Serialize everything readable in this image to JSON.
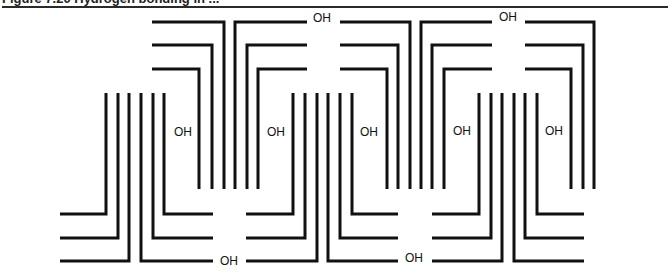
{
  "figure": {
    "caption": "Figure 7.20  Hydrogen bonding in ...",
    "label": "OH",
    "stroke_color": "#111111",
    "upper_rows_y": [
      22,
      45,
      69
    ],
    "lower_rows_y": [
      214,
      238,
      261
    ],
    "upper_vertical_bottom": 189,
    "lower_vertical_top": 93,
    "upper_units": [
      {
        "left_x": 152,
        "left_verts": [
          224,
          212,
          199
        ],
        "right_verts": [
          235,
          247,
          258
        ],
        "right_x": 307
      },
      {
        "left_x": 340,
        "left_verts": [
          410,
          398,
          387
        ],
        "right_verts": [
          421,
          432,
          444
        ],
        "right_x": 492
      },
      {
        "left_x": 525,
        "left_verts": [
          594,
          583,
          571
        ],
        "right_verts": [],
        "right_x": 594
      }
    ],
    "lower_units": [
      {
        "left_x": 60,
        "left_verts": [
          129,
          118,
          106
        ],
        "right_verts": [
          141,
          153,
          164
        ],
        "right_x": 213
      },
      {
        "left_x": 246,
        "left_verts": [
          317,
          305,
          293
        ],
        "right_verts": [
          328,
          340,
          352
        ],
        "right_x": 398
      },
      {
        "left_x": 432,
        "left_verts": [
          502,
          491,
          479
        ],
        "right_verts": [
          514,
          525,
          537
        ],
        "right_x": 584
      }
    ],
    "oh_labels": [
      {
        "x": 174,
        "y": 136,
        "text": "OH"
      },
      {
        "x": 267,
        "y": 136,
        "text": "OH"
      },
      {
        "x": 360,
        "y": 136,
        "text": "OH"
      },
      {
        "x": 453,
        "y": 135,
        "text": "OH"
      },
      {
        "x": 545,
        "y": 135,
        "text": "OH"
      },
      {
        "x": 313,
        "y": 22,
        "text": "OH"
      },
      {
        "x": 499,
        "y": 21,
        "text": "OH"
      },
      {
        "x": 220,
        "y": 265,
        "text": "OH"
      },
      {
        "x": 405,
        "y": 262,
        "text": "OH"
      }
    ]
  }
}
